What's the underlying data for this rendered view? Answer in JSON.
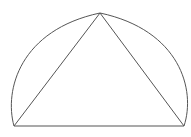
{
  "figure": {
    "stroke_color": "#555555",
    "background": "#ffffff",
    "points": {
      "bottom_left": [
        14,
        126
      ],
      "bottom_right": [
        184,
        126
      ],
      "apex": [
        100,
        13
      ]
    },
    "arc": {
      "rx": 92,
      "ry": 110
    }
  }
}
